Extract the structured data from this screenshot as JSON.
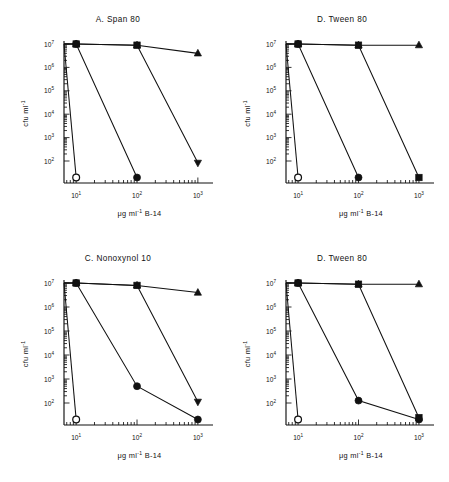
{
  "figure": {
    "background": "#ffffff",
    "ink": "#111111",
    "width": 449,
    "height": 482
  },
  "axes_common": {
    "ylabel_main": "cfu ml",
    "ylabel_sup": "-1",
    "xlabel_part1": "μg ml",
    "xlabel_sup": "-1",
    "xlabel_part2": "B-14",
    "y_ticklabels": [
      "10",
      "10",
      "10",
      "10",
      "10",
      "10"
    ],
    "y_tick_exponents": [
      "7",
      "6",
      "5",
      "4",
      "3",
      "2"
    ],
    "x_ticklabels": [
      "10",
      "10",
      "10"
    ],
    "x_tick_exponents": [
      "1",
      "2",
      "3"
    ],
    "ylim_log": [
      2,
      7
    ],
    "xlim_log": [
      0.8,
      3.15
    ],
    "floor_label": "below detection",
    "grid": "off",
    "legend": "none"
  },
  "chart_data": [
    {
      "panel_id": "A",
      "type": "line",
      "title": "A. Span 80",
      "xlabel": "μg ml-1 B-14",
      "ylabel": "cfu ml-1",
      "xscale": "log10",
      "yscale": "log10",
      "x": [
        10,
        100,
        1000
      ],
      "xlim": [
        0.8,
        3.15
      ],
      "ylim": [
        2,
        7
      ],
      "floor_value": 1.55,
      "series": [
        {
          "name": "open-circle",
          "marker": "circle-open",
          "values": [
            1.55,
            null,
            null
          ],
          "note": "drops from 1e7 at axis origin to floor at 10"
        },
        {
          "name": "filled-circle",
          "marker": "circle-filled",
          "values": [
            7.0,
            1.55,
            null
          ]
        },
        {
          "name": "filled-square",
          "marker": "square-filled",
          "values": [
            7.0,
            6.95,
            1.95
          ],
          "end_marker": "triangle-down"
        },
        {
          "name": "triangle-up",
          "marker": "triangle-up",
          "values": [
            7.0,
            6.95,
            6.6
          ]
        }
      ]
    },
    {
      "panel_id": "B",
      "type": "line",
      "title": "D. Tween 80",
      "xlabel": "μg ml-1 B-14",
      "ylabel": "cfu ml-1",
      "xscale": "log10",
      "yscale": "log10",
      "x": [
        10,
        100,
        1000
      ],
      "xlim": [
        0.8,
        3.15
      ],
      "ylim": [
        2,
        7
      ],
      "floor_value": 1.55,
      "series": [
        {
          "name": "open-circle",
          "marker": "circle-open",
          "values": [
            1.55,
            null,
            null
          ]
        },
        {
          "name": "filled-circle",
          "marker": "circle-filled",
          "values": [
            7.0,
            1.55,
            null
          ]
        },
        {
          "name": "filled-square",
          "marker": "square-filled",
          "values": [
            7.0,
            6.95,
            1.55
          ]
        },
        {
          "name": "triangle-up",
          "marker": "triangle-up",
          "values": [
            7.0,
            6.95,
            6.95
          ]
        }
      ]
    },
    {
      "panel_id": "C",
      "type": "line",
      "title": "C. Nonoxynol 10",
      "xlabel": "μg ml-1 B-14",
      "ylabel": "cfu ml-1",
      "xscale": "log10",
      "yscale": "log10",
      "x": [
        10,
        100,
        1000
      ],
      "xlim": [
        0.8,
        3.15
      ],
      "ylim": [
        2,
        7
      ],
      "floor_value": 1.55,
      "series": [
        {
          "name": "open-circle",
          "marker": "circle-open",
          "values": [
            1.55,
            null,
            null
          ]
        },
        {
          "name": "filled-circle",
          "marker": "circle-filled",
          "values": [
            7.0,
            2.7,
            1.55
          ]
        },
        {
          "name": "filled-square",
          "marker": "square-filled",
          "values": [
            7.0,
            6.9,
            2.05
          ],
          "end_marker": "triangle-down"
        },
        {
          "name": "triangle-up",
          "marker": "triangle-up",
          "values": [
            7.0,
            6.9,
            6.6
          ]
        }
      ]
    },
    {
      "panel_id": "D",
      "type": "line",
      "title": "D. Tween 80",
      "xlabel": "μg ml-1 B-14",
      "ylabel": "cfu ml-1",
      "xscale": "log10",
      "yscale": "log10",
      "x": [
        10,
        100,
        1000
      ],
      "xlim": [
        0.8,
        3.15
      ],
      "ylim": [
        2,
        7
      ],
      "floor_value": 1.55,
      "series": [
        {
          "name": "open-circle",
          "marker": "circle-open",
          "values": [
            1.55,
            null,
            null
          ]
        },
        {
          "name": "filled-circle",
          "marker": "circle-filled",
          "values": [
            7.0,
            2.1,
            1.55
          ]
        },
        {
          "name": "filled-square",
          "marker": "square-filled",
          "values": [
            7.0,
            6.95,
            1.6
          ]
        },
        {
          "name": "triangle-up",
          "marker": "triangle-up",
          "values": [
            7.0,
            6.95,
            6.95
          ]
        }
      ]
    }
  ],
  "panels": {
    "A": {
      "title": "A. Span 80"
    },
    "B": {
      "title": "D. Tween 80"
    },
    "C": {
      "title": "C. Nonoxynol 10"
    },
    "D": {
      "title": "D. Tween 80"
    }
  }
}
